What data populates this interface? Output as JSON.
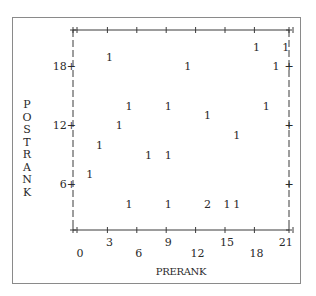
{
  "chart_data": {
    "type": "scatter",
    "style": "ascii-line-printer",
    "title": "",
    "xlabel": "PRERANK",
    "ylabel": "POSTRANK",
    "xlim": [
      0,
      21
    ],
    "ylim": [
      1,
      21
    ],
    "grid": false,
    "legend": null,
    "x_ticks": [
      0,
      3,
      6,
      9,
      12,
      15,
      18,
      21
    ],
    "y_ticks": [
      6,
      12,
      18
    ],
    "symbol_note": "Each plotted symbol is a count of observations at that point",
    "points": [
      {
        "x": 18,
        "y": 20,
        "count": 1
      },
      {
        "x": 21,
        "y": 20,
        "count": 1
      },
      {
        "x": 3,
        "y": 19,
        "count": 1
      },
      {
        "x": 11,
        "y": 18,
        "count": 1
      },
      {
        "x": 20,
        "y": 18,
        "count": 1
      },
      {
        "x": 5,
        "y": 14,
        "count": 1
      },
      {
        "x": 9,
        "y": 14,
        "count": 1
      },
      {
        "x": 19,
        "y": 14,
        "count": 1
      },
      {
        "x": 13,
        "y": 13,
        "count": 1
      },
      {
        "x": 4,
        "y": 12,
        "count": 1
      },
      {
        "x": 16,
        "y": 11,
        "count": 1
      },
      {
        "x": 2,
        "y": 10,
        "count": 1
      },
      {
        "x": 7,
        "y": 9,
        "count": 1
      },
      {
        "x": 9,
        "y": 9,
        "count": 1
      },
      {
        "x": 1,
        "y": 7,
        "count": 1
      },
      {
        "x": 5,
        "y": 4,
        "count": 1
      },
      {
        "x": 9,
        "y": 4,
        "count": 1
      },
      {
        "x": 13,
        "y": 4,
        "count": 2
      },
      {
        "x": 15,
        "y": 4,
        "count": 1
      },
      {
        "x": 16,
        "y": 4,
        "count": 1
      }
    ]
  },
  "labels": {
    "xlabel": "PRERANK",
    "ylabel_letters": [
      "P",
      "O",
      "S",
      "T",
      "R",
      "A",
      "N",
      "K"
    ]
  },
  "colors": {
    "ink": "#2a2a2a",
    "frame": "#8a8a8a",
    "background": "#ffffff"
  }
}
